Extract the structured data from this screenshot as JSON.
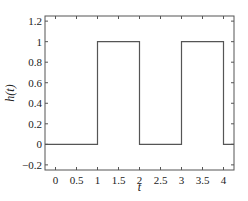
{
  "chart_data": {
    "type": "line",
    "title": "",
    "xlabel": "t",
    "ylabel": "h(t)",
    "xlim": [
      -0.25,
      4.25
    ],
    "ylim": [
      -0.25,
      1.25
    ],
    "xticks": [
      0,
      0.5,
      1,
      1.5,
      2,
      2.5,
      3,
      3.5,
      4
    ],
    "xtick_labels": [
      "0",
      "0.5",
      "1",
      "1.5",
      "2",
      "2.5",
      "3",
      "3.5",
      "4"
    ],
    "yticks": [
      -0.2,
      0,
      0.2,
      0.4,
      0.6,
      0.8,
      1,
      1.2
    ],
    "ytick_labels": [
      "−0.2",
      "0",
      "0.2",
      "0.4",
      "0.6",
      "0.8",
      "1",
      "1.2"
    ],
    "grid": false,
    "series": [
      {
        "name": "h(t)",
        "x": [
          -0.25,
          1,
          1,
          2,
          2,
          3,
          3,
          4,
          4,
          4.25
        ],
        "y": [
          0,
          0,
          1,
          1,
          0,
          0,
          1,
          1,
          0,
          0
        ],
        "color": "#555555"
      }
    ]
  }
}
